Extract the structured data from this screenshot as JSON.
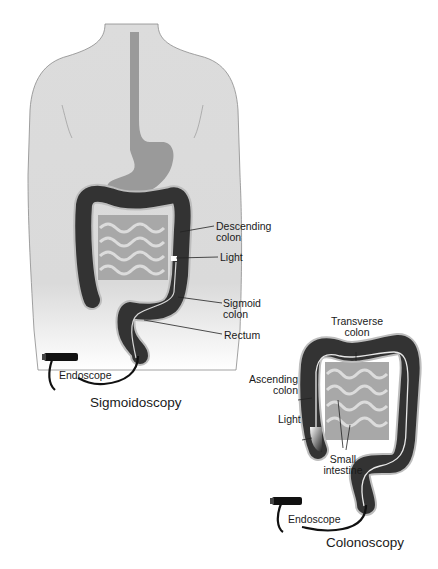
{
  "figure": {
    "panels": [
      {
        "id": "sigmoidoscopy",
        "caption": "Sigmoidoscopy",
        "labels": {
          "descending_colon": "Descending\ncolon",
          "descending_colon_l1": "Descending",
          "descending_colon_l2": "colon",
          "light": "Light",
          "sigmoid_colon_l1": "Sigmoid",
          "sigmoid_colon_l2": "colon",
          "rectum": "Rectum",
          "endoscope": "Endoscope"
        }
      },
      {
        "id": "colonoscopy",
        "caption": "Colonoscopy",
        "labels": {
          "transverse_colon_l1": "Transverse",
          "transverse_colon_l2": "colon",
          "ascending_colon_l1": "Ascending",
          "ascending_colon_l2": "colon",
          "light": "Light",
          "small_intestine_l1": "Small",
          "small_intestine_l2": "intestine",
          "endoscope": "Endoscope"
        }
      }
    ],
    "colors": {
      "body_fill": "#d9d9d9",
      "body_outline": "#8a8a8a",
      "esophagus_stomach": "#9a9a9a",
      "colon_dark": "#333333",
      "colon_outline": "#bdbdbd",
      "small_intestine": "#9d9d9d",
      "endoscope": "#111111",
      "text": "#1a1a1a"
    }
  }
}
